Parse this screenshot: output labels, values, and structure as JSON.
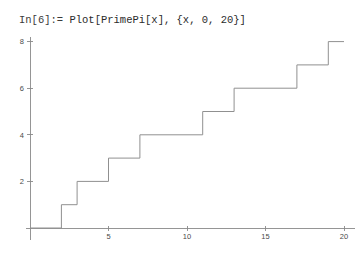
{
  "notebook": {
    "input_prompt": "In[6]:=",
    "input_expression": "Plot[PrimePi[x], {x, 0, 20}]",
    "input_full": "In[6]:= Plot[PrimePi[x], {x, 0, 20}]"
  },
  "colors": {
    "background": "#ffffff",
    "curve": "#909090",
    "axis": "#8a8a8a",
    "text": "#3a3a3a",
    "tick_label": "#4a4a4a"
  },
  "chart_data": {
    "type": "line",
    "subtype": "step",
    "title": "",
    "xlabel": "",
    "ylabel": "",
    "xlim": [
      0,
      20
    ],
    "ylim": [
      0,
      8
    ],
    "grid": false,
    "legend": false,
    "x_ticks": [
      5,
      10,
      15,
      20
    ],
    "x_tick_labels": [
      "5",
      "10",
      "15",
      "20"
    ],
    "y_ticks": [
      2,
      4,
      6,
      8
    ],
    "y_tick_labels": [
      "2",
      "4",
      "6",
      "8"
    ],
    "series": [
      {
        "name": "PrimePi[x]",
        "step_mode": "post",
        "jump_points": [
          2,
          3,
          5,
          7,
          11,
          13,
          17,
          19
        ],
        "x": [
          0,
          2,
          2,
          3,
          3,
          5,
          5,
          7,
          7,
          11,
          11,
          13,
          13,
          17,
          17,
          19,
          19,
          20
        ],
        "values": [
          0,
          0,
          1,
          1,
          2,
          2,
          3,
          3,
          4,
          4,
          5,
          5,
          6,
          6,
          7,
          7,
          8,
          8
        ]
      }
    ]
  }
}
